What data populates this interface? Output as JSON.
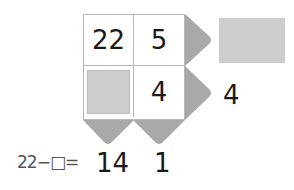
{
  "puzzle": {
    "grid": {
      "rows": [
        [
          {
            "value": "22",
            "blank": false
          },
          {
            "value": "5",
            "blank": false
          }
        ],
        [
          {
            "value": "",
            "blank": true
          },
          {
            "value": "4",
            "blank": false
          }
        ]
      ]
    },
    "row_results": [
      "",
      "4"
    ],
    "row_result_blank": [
      true,
      false
    ],
    "column_results": [
      "14",
      "1"
    ],
    "handwritten_note": "22−□=",
    "colors": {
      "arrow_fill": "#a9a9a9",
      "blank_fill": "#cdcdcd",
      "grid_border": "#b8b8b8",
      "text": "#1a1a1a"
    }
  }
}
